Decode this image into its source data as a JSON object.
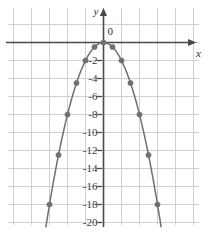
{
  "chart_data": {
    "type": "scatter",
    "title": "",
    "subtitle": "",
    "xlabel": "x",
    "ylabel": "y",
    "origin_label": "0",
    "grid": true,
    "legend": "none",
    "equation": "y = -2x^2",
    "xlim": [
      -5.25,
      5.75
    ],
    "ylim": [
      -21.5,
      2.5
    ],
    "x_ticks": [],
    "x_tick_labels": [],
    "y_ticks": [
      -2,
      -4,
      -6,
      -8,
      -10,
      -12,
      -14,
      -16,
      -18,
      -20
    ],
    "y_tick_labels": [
      "-2",
      "-4",
      "-6",
      "-8",
      "-10",
      "-12",
      "-14",
      "-16",
      "-18",
      "-20"
    ],
    "series": [
      {
        "name": "y = -2x^2",
        "color": "#6f6f72",
        "marker": "filled-circle",
        "x": [
          -3,
          -2.5,
          -2,
          -1.5,
          -1,
          -0.5,
          0,
          0.5,
          1,
          1.5,
          2,
          2.5,
          3
        ],
        "y": [
          -18,
          -12.5,
          -8,
          -4.5,
          -2,
          -0.5,
          0,
          -0.5,
          -2,
          -4.5,
          -8,
          -12.5,
          -18
        ]
      }
    ],
    "curve": {
      "name": "parabola",
      "color": "#6f6f72",
      "from_x": -3.2,
      "to_x": 3.2
    },
    "colors": {
      "grid": "#cfcfd4",
      "axis": "#4a4a4a",
      "curve": "#6f6f72",
      "point": "#6f6f72",
      "text": "#2b2b2b",
      "background": "#ffffff"
    }
  }
}
